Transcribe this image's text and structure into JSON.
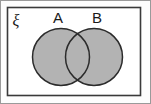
{
  "figure": {
    "kind": "venn-diagram",
    "universal_set": {
      "label": "ξ",
      "label_name": "xi-universal-set-symbol",
      "rect": {
        "x": 7,
        "y": 7,
        "width": 134,
        "height": 89
      },
      "stroke": "#3a3a3a",
      "fill": "#ffffff"
    },
    "sets": [
      {
        "id": "A",
        "label": "A",
        "cx": 61,
        "cy": 57,
        "r": 29,
        "fill": "#b3b3b3",
        "stroke": "#2b2b2b",
        "label_x": 58,
        "label_y": 23
      },
      {
        "id": "B",
        "label": "B",
        "cx": 94,
        "cy": 57,
        "r": 29,
        "fill": "#b3b3b3",
        "stroke": "#2b2b2b",
        "label_x": 97,
        "label_y": 23
      }
    ],
    "shading": {
      "region": "A union B",
      "description": "Both circles and their intersection are shaded the same uniform grey",
      "color": "#b3b3b3"
    },
    "colors": {
      "shade": "#b3b3b3",
      "outline": "#2b2b2b",
      "frame": "#3a3a3a",
      "page_border": "#9a9a9a",
      "background": "#fdfdfd",
      "text": "#1a1a1a"
    }
  }
}
